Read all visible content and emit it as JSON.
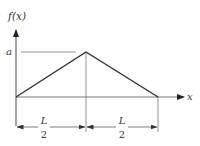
{
  "diagram": {
    "type": "triangular function plot",
    "y_axis_label": "f(x)",
    "x_axis_label": "x",
    "peak_label": "a",
    "dimensions": [
      {
        "numerator": "L",
        "denominator": "2"
      },
      {
        "numerator": "L",
        "denominator": "2"
      }
    ],
    "colors": {
      "line": "#333333",
      "guide": "#888888",
      "background": "#ffffff"
    }
  }
}
